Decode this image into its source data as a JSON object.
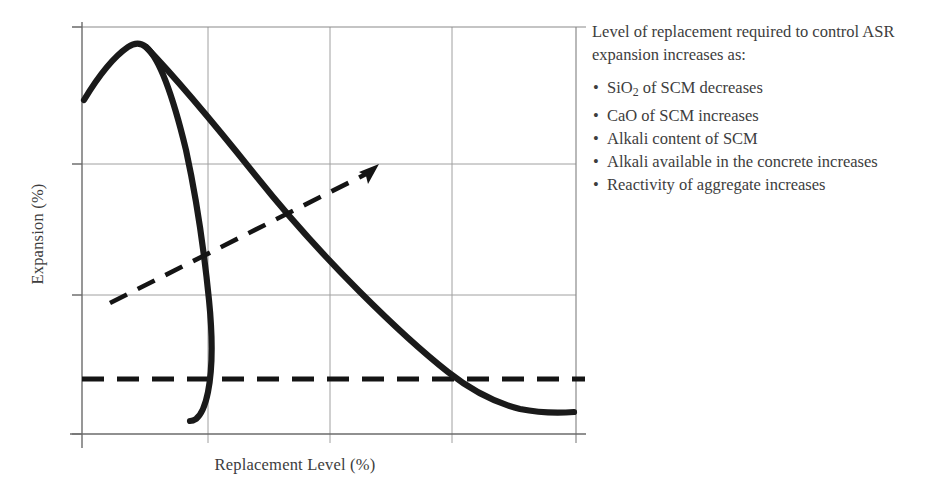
{
  "chart_data": {
    "type": "line",
    "title": "",
    "xlabel": "Replacement Level (%)",
    "ylabel": "Expansion (%)",
    "grid": true,
    "axis_tick_labels": {
      "x": [],
      "y": []
    },
    "series": [
      {
        "name": "low-reactivity / high-SiO2 SCM expansion curve",
        "style": "solid-thick",
        "points": [
          [
            0.4,
            70.0
          ],
          [
            4.0,
            82.0
          ],
          [
            8.0,
            90.0
          ],
          [
            11.8,
            95.0
          ],
          [
            14.0,
            95.3
          ],
          [
            16.5,
            92.0
          ],
          [
            20.0,
            78.0
          ],
          [
            22.5,
            62.0
          ],
          [
            24.0,
            48.0
          ],
          [
            25.2,
            34.0
          ],
          [
            26.3,
            22.0
          ],
          [
            28.0,
            14.5
          ],
          [
            30.5,
            10.0
          ],
          [
            34.0,
            7.0
          ],
          [
            37.5,
            5.5
          ],
          [
            41.0,
            4.9
          ],
          [
            44.0,
            4.8
          ]
        ]
      },
      {
        "name": "high-reactivity / high-CaO SCM expansion curve",
        "style": "solid-thick",
        "points": [
          [
            14.0,
            95.3
          ],
          [
            20.0,
            83.0
          ],
          [
            28.0,
            69.0
          ],
          [
            36.0,
            56.0
          ],
          [
            44.0,
            46.0
          ],
          [
            52.0,
            37.0
          ],
          [
            60.0,
            28.5
          ],
          [
            68.0,
            21.0
          ],
          [
            76.0,
            15.0
          ],
          [
            84.0,
            10.5
          ],
          [
            92.0,
            8.0
          ],
          [
            100.0,
            7.0
          ]
        ]
      }
    ],
    "reference_lines": [
      {
        "name": "expansion-limit-threshold",
        "orientation": "horizontal",
        "style": "dashed-thick",
        "y": 13.5
      }
    ],
    "annotations": [
      {
        "name": "increasing-replacement-arrow",
        "style": "dashed-arrow",
        "from": [
          6.0,
          32.5
        ],
        "to": [
          60.0,
          66.0
        ]
      }
    ],
    "gridlines": {
      "x": [
        25.5,
        50.0,
        75.0
      ],
      "y": [
        33.0,
        66.0
      ]
    },
    "xlim": [
      0,
      100
    ],
    "ylim": [
      0,
      100
    ]
  },
  "chart": {
    "x_axis_title": "Replacement Level (%)",
    "y_axis_title": "Expansion (%)"
  },
  "annotation": {
    "intro": "Level of replacement required to control ASR expansion increases as:",
    "bullet_char": "•",
    "bullets": [
      {
        "prefix": "SiO",
        "sub": "2",
        "suffix": " of SCM decreases"
      },
      {
        "prefix": "CaO of SCM increases",
        "sub": "",
        "suffix": ""
      },
      {
        "prefix": "Alkali content of SCM",
        "sub": "",
        "suffix": ""
      },
      {
        "prefix": "Alkali available in the concrete increases",
        "sub": "",
        "suffix": ""
      },
      {
        "prefix": "Reactivity of aggregate increases",
        "sub": "",
        "suffix": ""
      }
    ]
  },
  "colors": {
    "curve": "#1a1a1a",
    "grid": "#9a9a9a",
    "axis": "#6b6b6b",
    "text": "#3d3d3d",
    "background": "#ffffff"
  }
}
